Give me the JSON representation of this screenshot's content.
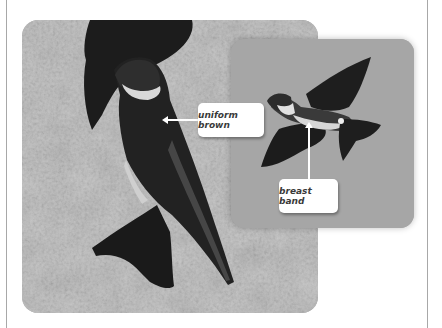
{
  "figure": {
    "main_photo": {
      "subject": "perched swallow on sandy cliff",
      "tone": "grayscale"
    },
    "inset_photo": {
      "subject": "swallow in flight",
      "tone": "grayscale"
    },
    "callouts": [
      {
        "label": "uniform brown",
        "points_to": "perched bird back"
      },
      {
        "label": "breast band",
        "points_to": "flying bird breast"
      }
    ]
  }
}
